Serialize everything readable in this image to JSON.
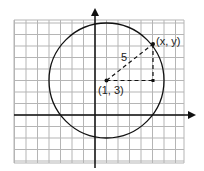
{
  "diagram": {
    "type": "coordinate-plane-circle",
    "grid": {
      "x_min": -7,
      "x_max": 8,
      "y_min": -4,
      "y_max": 8,
      "grid_color": "#b5b5b5"
    },
    "axes": {
      "color": "#111111"
    },
    "circle": {
      "center": [
        1,
        3
      ],
      "radius": 5,
      "color": "#111111"
    },
    "point_on_circle": [
      4,
      7
    ],
    "labels": {
      "center": "(1, 3)",
      "point": "(x, y)",
      "radius": "5"
    }
  }
}
